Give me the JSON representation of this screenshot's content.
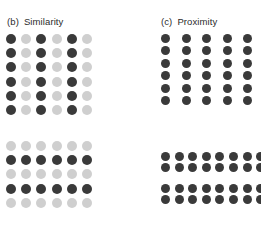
{
  "figure": {
    "kind": "gestalt-grouping-figure",
    "background_color": "#ffffff",
    "dot_colors": {
      "dark": "#3a3a3a",
      "light": "#cfcfcf"
    }
  },
  "panels": [
    {
      "id": "similarity",
      "tag": "(b)",
      "title": "Similarity",
      "grids": [
        {
          "id": "similarity-columns",
          "grouping": "columns",
          "rows": 6,
          "cols": 6,
          "pattern": [
            [
              "dark",
              "light",
              "dark",
              "light",
              "dark",
              "light"
            ],
            [
              "dark",
              "light",
              "dark",
              "light",
              "dark",
              "light"
            ],
            [
              "dark",
              "light",
              "dark",
              "light",
              "dark",
              "light"
            ],
            [
              "dark",
              "light",
              "dark",
              "light",
              "dark",
              "light"
            ],
            [
              "dark",
              "light",
              "dark",
              "light",
              "dark",
              "light"
            ],
            [
              "dark",
              "light",
              "dark",
              "light",
              "dark",
              "light"
            ]
          ]
        },
        {
          "id": "similarity-rows",
          "grouping": "rows",
          "rows": 5,
          "cols": 6,
          "pattern": [
            [
              "light",
              "light",
              "light",
              "light",
              "light",
              "light"
            ],
            [
              "dark",
              "dark",
              "dark",
              "dark",
              "dark",
              "dark"
            ],
            [
              "light",
              "light",
              "light",
              "light",
              "light",
              "light"
            ],
            [
              "dark",
              "dark",
              "dark",
              "dark",
              "dark",
              "dark"
            ],
            [
              "light",
              "light",
              "light",
              "light",
              "light",
              "light"
            ]
          ]
        }
      ]
    },
    {
      "id": "proximity",
      "tag": "(c)",
      "title": "Proximity",
      "grids": [
        {
          "id": "proximity-columns",
          "grouping": "columns",
          "rows": 6,
          "cols": 6,
          "pattern": [
            [
              "dark",
              "dark",
              "dark",
              "dark",
              "dark",
              "dark"
            ],
            [
              "dark",
              "dark",
              "dark",
              "dark",
              "dark",
              "dark"
            ],
            [
              "dark",
              "dark",
              "dark",
              "dark",
              "dark",
              "dark"
            ],
            [
              "dark",
              "dark",
              "dark",
              "dark",
              "dark",
              "dark"
            ],
            [
              "dark",
              "dark",
              "dark",
              "dark",
              "dark",
              "dark"
            ],
            [
              "dark",
              "dark",
              "dark",
              "dark",
              "dark",
              "dark"
            ]
          ]
        },
        {
          "id": "proximity-rows",
          "grouping": "rows",
          "rows": 4,
          "cols": 8,
          "row_group_breaks": [
            1
          ],
          "pattern": [
            [
              "dark",
              "dark",
              "dark",
              "dark",
              "dark",
              "dark",
              "dark",
              "dark"
            ],
            [
              "dark",
              "dark",
              "dark",
              "dark",
              "dark",
              "dark",
              "dark",
              "dark"
            ],
            [
              "dark",
              "dark",
              "dark",
              "dark",
              "dark",
              "dark",
              "dark",
              "dark"
            ],
            [
              "dark",
              "dark",
              "dark",
              "dark",
              "dark",
              "dark",
              "dark",
              "dark"
            ]
          ]
        }
      ]
    }
  ],
  "cropped_top_row": {
    "note": "partial row of dots clipped by the top edge of the screenshot",
    "cols": 6,
    "pattern": [
      [
        "light",
        "light",
        "light",
        "light",
        "light",
        "light"
      ]
    ]
  }
}
